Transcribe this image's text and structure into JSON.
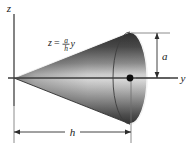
{
  "figure": {
    "type": "cone-diagram",
    "background_color": "#ffffff",
    "axes": {
      "vertical": {
        "label": "z",
        "name": "z-axis",
        "x": 14,
        "y_top": 14,
        "y_bottom": 106,
        "label_x": 11,
        "label_y": 11
      },
      "horizontal": {
        "label": "y",
        "name": "y-axis",
        "y": 78,
        "x_left": 8,
        "x_right": 178,
        "label_x": 182,
        "label_y": 82
      },
      "axis_color": "#545454"
    },
    "equation": {
      "lhs": "z",
      "operator": "=",
      "numerator": "a",
      "denominator": "h",
      "variable": "y",
      "full_text": "z = (a/h)y",
      "x": 48,
      "y": 46
    },
    "dimensions": [
      {
        "label": "a",
        "name": "radius-dimension",
        "orientation": "vertical",
        "x": 157,
        "y_start": 33,
        "y_end": 78,
        "label_x": 161,
        "label_y": 60,
        "meaning": "cone base radius"
      },
      {
        "label": "h",
        "name": "height-dimension",
        "orientation": "horizontal",
        "y": 132,
        "x_start": 14,
        "x_end": 131,
        "label_x": 72,
        "label_y": 136,
        "meaning": "cone height along y-axis"
      }
    ],
    "cone": {
      "apex": {
        "x": 14,
        "y": 78
      },
      "base_center": {
        "x": 130,
        "y": 78
      },
      "base_rx": 17,
      "base_ry": 46,
      "fill_light": "#cfcfcf",
      "fill_mid": "#a3a3a3",
      "fill_dark": "#3a3a3a",
      "outline_color": "#2b2b2b",
      "center_dot": {
        "x": 130,
        "y": 78,
        "r": 3.2,
        "color": "#111111"
      }
    },
    "extension_lines": {
      "color": "#6b6b6b",
      "top_from_x": 133,
      "top_to_x": 170,
      "top_y": 33,
      "right_from_x": 136,
      "right_to_x": 170,
      "right_y": 78,
      "bottom_left_x": 14,
      "bottom_right_x": 131,
      "bottom_y_top": 110,
      "bottom_y_end": 143
    }
  }
}
